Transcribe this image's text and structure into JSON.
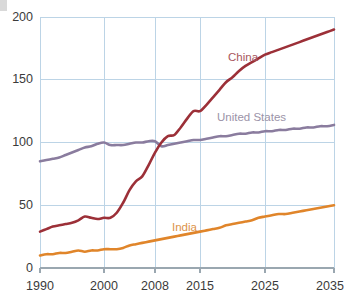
{
  "chart_data": {
    "type": "line",
    "title": "",
    "subtitle": "",
    "xlabel": "",
    "ylabel": "",
    "xlim": [
      1990,
      2035
    ],
    "ylim": [
      0,
      200
    ],
    "grid": true,
    "legend_position": "inline-annotations",
    "x_tick_labels": [
      "1990",
      "2000",
      "2008",
      "2015",
      "2025",
      "2035"
    ],
    "x_tick_values": [
      1990,
      2000,
      2008,
      2015,
      2025,
      2035
    ],
    "y_tick_labels": [
      "0",
      "50",
      "100",
      "150",
      "200"
    ],
    "y_tick_values": [
      0,
      50,
      100,
      150,
      200
    ],
    "series": [
      {
        "name": "China",
        "color": "#9c3038",
        "label_color": "#a8565c",
        "x": [
          1990,
          1991,
          1992,
          1993,
          1994,
          1995,
          1996,
          1997,
          1998,
          1999,
          2000,
          2001,
          2002,
          2003,
          2004,
          2005,
          2006,
          2007,
          2008,
          2009,
          2010,
          2011,
          2012,
          2013,
          2014,
          2015,
          2016,
          2017,
          2018,
          2019,
          2020,
          2021,
          2022,
          2023,
          2024,
          2025,
          2026,
          2027,
          2028,
          2029,
          2030,
          2031,
          2032,
          2033,
          2034,
          2035
        ],
        "values": [
          29,
          31,
          33,
          34,
          35,
          36,
          38,
          41,
          40,
          39,
          40,
          40,
          44,
          52,
          62,
          69,
          73,
          82,
          92,
          100,
          105,
          106,
          112,
          119,
          125,
          125,
          130,
          136,
          142,
          148,
          152,
          157,
          161,
          164,
          167,
          170,
          172,
          174,
          176,
          178,
          180,
          182,
          184,
          186,
          188,
          190
        ]
      },
      {
        "name": "United States",
        "color": "#8a7c9e",
        "label_color": "#9b93a8",
        "x": [
          1990,
          1991,
          1992,
          1993,
          1994,
          1995,
          1996,
          1997,
          1998,
          1999,
          2000,
          2001,
          2002,
          2003,
          2004,
          2005,
          2006,
          2007,
          2008,
          2009,
          2010,
          2011,
          2012,
          2013,
          2014,
          2015,
          2016,
          2017,
          2018,
          2019,
          2020,
          2021,
          2022,
          2023,
          2024,
          2025,
          2026,
          2027,
          2028,
          2029,
          2030,
          2031,
          2032,
          2033,
          2034,
          2035
        ],
        "values": [
          85,
          86,
          87,
          88,
          90,
          92,
          94,
          96,
          97,
          99,
          100,
          98,
          98,
          98,
          99,
          100,
          100,
          101,
          101,
          97,
          98,
          99,
          100,
          101,
          102,
          102,
          103,
          104,
          105,
          105,
          106,
          107,
          107,
          108,
          108,
          109,
          109,
          110,
          110,
          111,
          111,
          112,
          112,
          113,
          113,
          114
        ]
      },
      {
        "name": "India",
        "color": "#e0852a",
        "label_color": "#dd9248",
        "x": [
          1990,
          1991,
          1992,
          1993,
          1994,
          1995,
          1996,
          1997,
          1998,
          1999,
          2000,
          2001,
          2002,
          2003,
          2004,
          2005,
          2006,
          2007,
          2008,
          2009,
          2010,
          2011,
          2012,
          2013,
          2014,
          2015,
          2016,
          2017,
          2018,
          2019,
          2020,
          2021,
          2022,
          2023,
          2024,
          2025,
          2026,
          2027,
          2028,
          2029,
          2030,
          2031,
          2032,
          2033,
          2034,
          2035
        ],
        "values": [
          10,
          11,
          11,
          12,
          12,
          13,
          14,
          13,
          14,
          14,
          15,
          15,
          15,
          16,
          18,
          19,
          20,
          21,
          22,
          23,
          24,
          25,
          26,
          27,
          28,
          29,
          30,
          31,
          32,
          34,
          35,
          36,
          37,
          38,
          40,
          41,
          42,
          43,
          43,
          44,
          45,
          46,
          47,
          48,
          49,
          50
        ]
      }
    ],
    "annotations": [
      {
        "text": "China",
        "series": "China"
      },
      {
        "text": "United States",
        "series": "United States"
      },
      {
        "text": "India",
        "series": "India"
      }
    ]
  }
}
